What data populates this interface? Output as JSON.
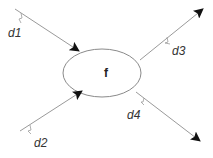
{
  "diagram": {
    "node": {
      "label": "f",
      "cx": 102,
      "cy": 73,
      "rx": 39,
      "ry": 24
    },
    "edges": [
      {
        "id": "d1",
        "label": "d1",
        "direction": "in",
        "from": [
          15,
          9
        ],
        "to": [
          79,
          51
        ]
      },
      {
        "id": "d2",
        "label": "d2",
        "direction": "in",
        "from": [
          20,
          131
        ],
        "to": [
          82,
          91
        ]
      },
      {
        "id": "d3",
        "label": "d3",
        "direction": "out",
        "from": [
          140,
          60
        ],
        "to": [
          203,
          9
        ]
      },
      {
        "id": "d4",
        "label": "d4",
        "direction": "out",
        "from": [
          136,
          92
        ],
        "to": [
          200,
          141
        ]
      }
    ],
    "colors": {
      "line": "#9a9a9a",
      "arrowhead": "#111111",
      "ellipse": "#8a8a8a"
    }
  }
}
